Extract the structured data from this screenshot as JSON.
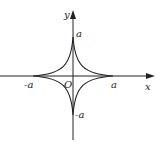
{
  "diagram": {
    "curve": "x^(2/3) + y^(2/3) = a^(2/3)",
    "labels": {
      "y_axis": "y",
      "x_axis": "x",
      "origin": "O",
      "top": "a",
      "bottom": "-a",
      "left": "-a",
      "right": "a"
    },
    "colors": {
      "stroke": "#222222",
      "background": "#ffffff"
    }
  }
}
